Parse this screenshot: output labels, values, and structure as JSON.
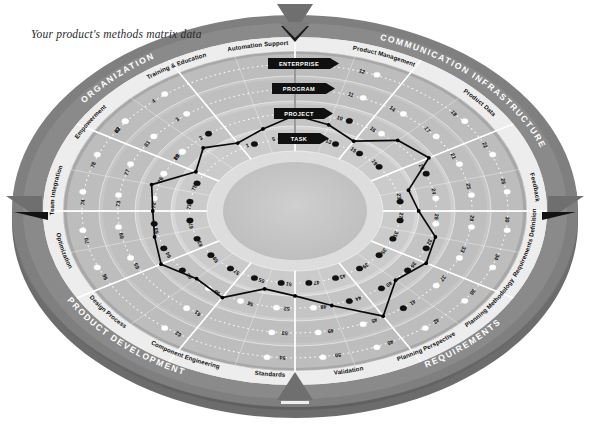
{
  "caption": "Your product's methods matrix data",
  "chart_data": {
    "type": "radar",
    "title": "Your product's methods matrix data",
    "grid": true,
    "legend_position": "none",
    "quadrants": [
      {
        "name": "ORGANIZATION",
        "start_deg": 180,
        "end_deg": 270,
        "color": "#7d7d7d"
      },
      {
        "name": "COMMUNICATION INFRASTRUCTURE",
        "start_deg": 270,
        "end_deg": 0,
        "color": "#7d7d7d"
      },
      {
        "name": "REQUIREMENTS",
        "start_deg": 0,
        "end_deg": 90,
        "color": "#7d7d7d"
      },
      {
        "name": "PRODUCT DEVELOPMENT",
        "start_deg": 90,
        "end_deg": 180,
        "color": "#7d7d7d"
      }
    ],
    "sub_sectors": [
      {
        "name": "Team Integration",
        "quadrant": "ORGANIZATION"
      },
      {
        "name": "Empowerment",
        "quadrant": "ORGANIZATION"
      },
      {
        "name": "Training & Education",
        "quadrant": "ORGANIZATION"
      },
      {
        "name": "Automation Support",
        "quadrant": "COMMUNICATION INFRASTRUCTURE"
      },
      {
        "name": "Product Management",
        "quadrant": "COMMUNICATION INFRASTRUCTURE"
      },
      {
        "name": "Product Data",
        "quadrant": "COMMUNICATION INFRASTRUCTURE"
      },
      {
        "name": "Feedback",
        "quadrant": "REQUIREMENTS"
      },
      {
        "name": "Requirements Definition",
        "quadrant": "REQUIREMENTS"
      },
      {
        "name": "Planning Methodology",
        "quadrant": "REQUIREMENTS"
      },
      {
        "name": "Planning Perspective",
        "quadrant": "REQUIREMENTS"
      },
      {
        "name": "Validation",
        "quadrant": "PRODUCT DEVELOPMENT"
      },
      {
        "name": "Standards",
        "quadrant": "PRODUCT DEVELOPMENT"
      },
      {
        "name": "Component Engineering",
        "quadrant": "PRODUCT DEVELOPMENT"
      },
      {
        "name": "Design Process",
        "quadrant": "PRODUCT DEVELOPMENT"
      },
      {
        "name": "Optimization",
        "quadrant": "PRODUCT DEVELOPMENT"
      }
    ],
    "levels": [
      {
        "label": "ENTERPRISE",
        "ring": 4
      },
      {
        "label": "PROGRAM",
        "ring": 3
      },
      {
        "label": "PROJECT",
        "ring": 2
      },
      {
        "label": "TASK",
        "ring": 1
      }
    ],
    "ring_colors": [
      "#d9d9d9",
      "#c9c9c9",
      "#bcbcbc",
      "#b0b0b0",
      "#a4a4a4"
    ],
    "cells": [
      {
        "n": 1,
        "ring": 1,
        "spoke": 22,
        "status": "filled"
      },
      {
        "n": 2,
        "ring": 2,
        "spoke": 21,
        "status": "filled"
      },
      {
        "n": 3,
        "ring": 3,
        "spoke": 21,
        "status": "open"
      },
      {
        "n": 4,
        "ring": 4,
        "spoke": 21,
        "status": "open"
      },
      {
        "n": 5,
        "ring": 1,
        "spoke": 23,
        "status": "filled"
      },
      {
        "n": 6,
        "ring": 2,
        "spoke": 0,
        "status": "filled"
      },
      {
        "n": 7,
        "ring": 3,
        "spoke": 0,
        "status": "open"
      },
      {
        "n": 8,
        "ring": 4,
        "spoke": 0,
        "status": "open"
      },
      {
        "n": 9,
        "ring": 1,
        "spoke": 0,
        "status": "filled"
      },
      {
        "n": 10,
        "ring": 2,
        "spoke": 1,
        "status": "filled"
      },
      {
        "n": 11,
        "ring": 3,
        "spoke": 1,
        "status": "open"
      },
      {
        "n": 12,
        "ring": 4,
        "spoke": 1,
        "status": "open"
      },
      {
        "n": 13,
        "ring": 1,
        "spoke": 1,
        "status": "filled"
      },
      {
        "n": 14,
        "ring": 3,
        "spoke": 2,
        "status": "open"
      },
      {
        "n": 15,
        "ring": 1,
        "spoke": 2,
        "status": "filled"
      },
      {
        "n": 16,
        "ring": 2,
        "spoke": 2,
        "status": "open"
      },
      {
        "n": 17,
        "ring": 3,
        "spoke": 3,
        "status": "open"
      },
      {
        "n": 18,
        "ring": 4,
        "spoke": 3,
        "status": "open"
      },
      {
        "n": 19,
        "ring": 1,
        "spoke": 3,
        "status": "filled"
      },
      {
        "n": 20,
        "ring": 2,
        "spoke": 4,
        "status": "filled"
      },
      {
        "n": 21,
        "ring": 3,
        "spoke": 4,
        "status": "open"
      },
      {
        "n": 22,
        "ring": 4,
        "spoke": 4,
        "status": "open"
      },
      {
        "n": 23,
        "ring": 1,
        "spoke": 5,
        "status": "filled"
      },
      {
        "n": 24,
        "ring": 2,
        "spoke": 5,
        "status": "open"
      },
      {
        "n": 25,
        "ring": 3,
        "spoke": 5,
        "status": "open"
      },
      {
        "n": 26,
        "ring": 4,
        "spoke": 5,
        "status": "open"
      },
      {
        "n": 27,
        "ring": 1,
        "spoke": 6,
        "status": "filled"
      },
      {
        "n": 28,
        "ring": 2,
        "spoke": 6,
        "status": "open"
      },
      {
        "n": 29,
        "ring": 3,
        "spoke": 6,
        "status": "open"
      },
      {
        "n": 30,
        "ring": 4,
        "spoke": 6,
        "status": "open"
      },
      {
        "n": 31,
        "ring": 1,
        "spoke": 7,
        "status": "filled"
      },
      {
        "n": 32,
        "ring": 2,
        "spoke": 7,
        "status": "filled"
      },
      {
        "n": 33,
        "ring": 3,
        "spoke": 7,
        "status": "open"
      },
      {
        "n": 34,
        "ring": 4,
        "spoke": 7,
        "status": "open"
      },
      {
        "n": 35,
        "ring": 1,
        "spoke": 8,
        "status": "filled"
      },
      {
        "n": 36,
        "ring": 2,
        "spoke": 8,
        "status": "filled"
      },
      {
        "n": 37,
        "ring": 3,
        "spoke": 8,
        "status": "open"
      },
      {
        "n": 38,
        "ring": 4,
        "spoke": 8,
        "status": "open"
      },
      {
        "n": 39,
        "ring": 1,
        "spoke": 9,
        "status": "filled"
      },
      {
        "n": 40,
        "ring": 2,
        "spoke": 9,
        "status": "filled"
      },
      {
        "n": 41,
        "ring": 3,
        "spoke": 9,
        "status": "filled"
      },
      {
        "n": 42,
        "ring": 4,
        "spoke": 9,
        "status": "open"
      },
      {
        "n": 43,
        "ring": 1,
        "spoke": 10,
        "status": "filled"
      },
      {
        "n": 44,
        "ring": 2,
        "spoke": 10,
        "status": "filled"
      },
      {
        "n": 45,
        "ring": 3,
        "spoke": 10,
        "status": "open"
      },
      {
        "n": 46,
        "ring": 4,
        "spoke": 10,
        "status": "open"
      },
      {
        "n": 47,
        "ring": 1,
        "spoke": 11,
        "status": "filled"
      },
      {
        "n": 48,
        "ring": 2,
        "spoke": 11,
        "status": "open"
      },
      {
        "n": 49,
        "ring": 3,
        "spoke": 11,
        "status": "open"
      },
      {
        "n": 50,
        "ring": 4,
        "spoke": 11,
        "status": "open"
      },
      {
        "n": 51,
        "ring": 1,
        "spoke": 12,
        "status": "filled"
      },
      {
        "n": 52,
        "ring": 2,
        "spoke": 12,
        "status": "open"
      },
      {
        "n": 53,
        "ring": 3,
        "spoke": 12,
        "status": "open"
      },
      {
        "n": 54,
        "ring": 4,
        "spoke": 12,
        "status": "open"
      },
      {
        "n": 55,
        "ring": 1,
        "spoke": 13,
        "status": "filled"
      },
      {
        "n": 56,
        "ring": 2,
        "spoke": 13,
        "status": "open"
      },
      {
        "n": 57,
        "ring": 1,
        "spoke": 14,
        "status": "filled"
      },
      {
        "n": 58,
        "ring": 2,
        "spoke": 14,
        "status": "open"
      },
      {
        "n": 59,
        "ring": 1,
        "spoke": 15,
        "status": "filled"
      },
      {
        "n": 60,
        "ring": 2,
        "spoke": 15,
        "status": "filled"
      },
      {
        "n": 61,
        "ring": 3,
        "spoke": 14,
        "status": "open"
      },
      {
        "n": 62,
        "ring": 4,
        "spoke": 14,
        "status": "open"
      },
      {
        "n": 63,
        "ring": 1,
        "spoke": 16,
        "status": "filled"
      },
      {
        "n": 64,
        "ring": 2,
        "spoke": 16,
        "status": "filled"
      },
      {
        "n": 65,
        "ring": 3,
        "spoke": 16,
        "status": "open"
      },
      {
        "n": 66,
        "ring": 4,
        "spoke": 16,
        "status": "open"
      },
      {
        "n": 67,
        "ring": 1,
        "spoke": 17,
        "status": "filled"
      },
      {
        "n": 68,
        "ring": 2,
        "spoke": 17,
        "status": "filled"
      },
      {
        "n": 69,
        "ring": 3,
        "spoke": 17,
        "status": "open"
      },
      {
        "n": 70,
        "ring": 4,
        "spoke": 17,
        "status": "open"
      },
      {
        "n": 71,
        "ring": 1,
        "spoke": 18,
        "status": "filled"
      },
      {
        "n": 72,
        "ring": 2,
        "spoke": 18,
        "status": "open"
      },
      {
        "n": 73,
        "ring": 3,
        "spoke": 18,
        "status": "open"
      },
      {
        "n": 74,
        "ring": 4,
        "spoke": 18,
        "status": "open"
      },
      {
        "n": 75,
        "ring": 1,
        "spoke": 19,
        "status": "filled"
      },
      {
        "n": 76,
        "ring": 2,
        "spoke": 19,
        "status": "open"
      },
      {
        "n": 77,
        "ring": 3,
        "spoke": 19,
        "status": "open"
      },
      {
        "n": 78,
        "ring": 4,
        "spoke": 19,
        "status": "open"
      },
      {
        "n": 79,
        "ring": 2,
        "spoke": 20,
        "status": "open"
      },
      {
        "n": 80,
        "ring": 2,
        "spoke": 20,
        "status": "open"
      },
      {
        "n": 81,
        "ring": 3,
        "spoke": 20,
        "status": "open"
      },
      {
        "n": 82,
        "ring": 4,
        "spoke": 20,
        "status": "open"
      },
      {
        "n": 83,
        "ring": 4,
        "spoke": 20,
        "status": "open"
      }
    ],
    "profile_spokes": 24,
    "profile_values": [
      2.05,
      1.75,
      1.35,
      2.25,
      2.55,
      1.35,
      1.55,
      2.25,
      2.45,
      2.15,
      3.25,
      2.15,
      1.55,
      1.35,
      2.25,
      2.05,
      2.55,
      2.25,
      2.15,
      2.35,
      1.25,
      1.75,
      1.25,
      1.55
    ],
    "markers": [
      {
        "position": "top",
        "shape": "triangle-down"
      },
      {
        "position": "right",
        "shape": "triangle-left"
      },
      {
        "position": "bottom",
        "shape": "triangle-up"
      },
      {
        "position": "left",
        "shape": "triangle-right"
      }
    ]
  },
  "colors": {
    "outer_band": "#7d7d7d",
    "outer_band_dark": "#6d6d6d",
    "sub_band": "#e6e6e6",
    "profile_line": "#0a0a0a",
    "dot_filled": "#121212",
    "dot_open": "#ffffff",
    "level_flag": "#101010",
    "spoke": "#ffffff",
    "hub": "#c2c2c2",
    "marker": "#6f6f6f"
  }
}
